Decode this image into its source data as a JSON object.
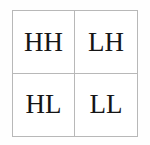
{
  "diagram": {
    "name": "wavelet-subband-quadrants",
    "background_color": "#fefefe",
    "border_color": "#b8b8b8",
    "cell_background": "#ffffff",
    "text_color": "#151515",
    "quadrants": [
      {
        "id": "hh",
        "label": "HH",
        "position": "top-left"
      },
      {
        "id": "lh",
        "label": "LH",
        "position": "top-right"
      },
      {
        "id": "hl",
        "label": "HL",
        "position": "bottom-left"
      },
      {
        "id": "ll",
        "label": "LL",
        "position": "bottom-right"
      }
    ]
  }
}
